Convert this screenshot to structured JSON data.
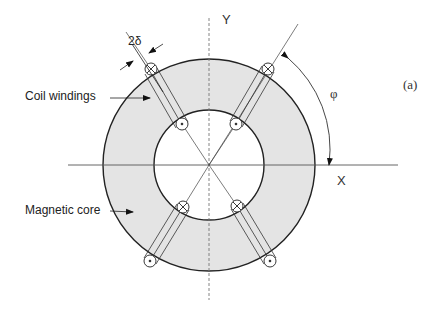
{
  "figure": {
    "panel_label": "(a)",
    "axes": {
      "x_label": "X",
      "y_label": "Y"
    },
    "angle_label": "φ",
    "gap_label": "2δ",
    "annotations": [
      {
        "id": "coil",
        "text": "Coil windings"
      },
      {
        "id": "core",
        "text": "Magnetic core"
      }
    ],
    "colors": {
      "core_fill": "#e4e4e4",
      "stroke": "#222222",
      "axis": "#555555"
    }
  }
}
